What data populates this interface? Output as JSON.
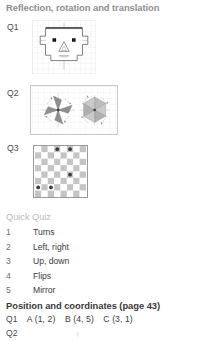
{
  "page": {
    "background": "#ffffff",
    "width": 199,
    "height": 341
  },
  "sections": {
    "reflection": {
      "title": "Reflection, rotation and translation",
      "title_color": "#8d8d8d",
      "questions": [
        {
          "label": "Q1",
          "figure": "face-grid-figure"
        },
        {
          "label": "Q2",
          "figure": "pinwheel-rotation-figure"
        },
        {
          "label": "Q3",
          "figure": "checkerboard-figure"
        }
      ]
    },
    "quick_quiz": {
      "heading": "Quick Quiz",
      "heading_color": "#b9b9b9",
      "items": [
        {
          "num": "1",
          "text": "Turns"
        },
        {
          "num": "2",
          "text": "Left, right"
        },
        {
          "num": "3",
          "text": "Up, down"
        },
        {
          "num": "4",
          "text": "Flips"
        },
        {
          "num": "5",
          "text": "Mirror"
        }
      ]
    },
    "position": {
      "title": "Position and coordinates (page 43)",
      "title_color": "#3a3a3a",
      "answers": [
        {
          "label": "Q1",
          "values": [
            "A (1, 2)",
            "B (4, 5)",
            "C (3, 1)"
          ]
        },
        {
          "label": "Q2",
          "values": []
        }
      ],
      "q2_mark": "⌇"
    }
  },
  "figures": {
    "q1_face": {
      "type": "grid-drawing",
      "grid_cols": 12,
      "grid_rows": 10,
      "grid_color": "#d9d9d9",
      "outline_color": "#555555",
      "accent_color": "#1a1a1a",
      "description": "Robot face outline on squared grid with mirror line across the top, two square eyes, triangular nose and mouth"
    },
    "q2_pinwheels": {
      "type": "rotation-diagram",
      "grid_color": "#dcdcdc",
      "border_color": "#c9c9c9",
      "shapes": [
        {
          "name": "pinwheel-left",
          "blades": 4,
          "fill": "#8a8a8a",
          "rotation_arrows": 4
        },
        {
          "name": "pinwheel-right",
          "blades": 4,
          "fill": "#b5b5b5",
          "rotation_arrows": 4
        }
      ]
    },
    "q3_checkerboard": {
      "type": "checkerboard",
      "cols": 8,
      "rows": 8,
      "light_color": "#ffffff",
      "dark_color": "#c4c4c4",
      "dot_color": "#3c3c3c",
      "dots": [
        {
          "col": 4,
          "row": 1
        },
        {
          "col": 6,
          "row": 1
        },
        {
          "col": 6,
          "row": 5
        },
        {
          "col": 1,
          "row": 7
        },
        {
          "col": 3,
          "row": 7
        }
      ]
    }
  }
}
